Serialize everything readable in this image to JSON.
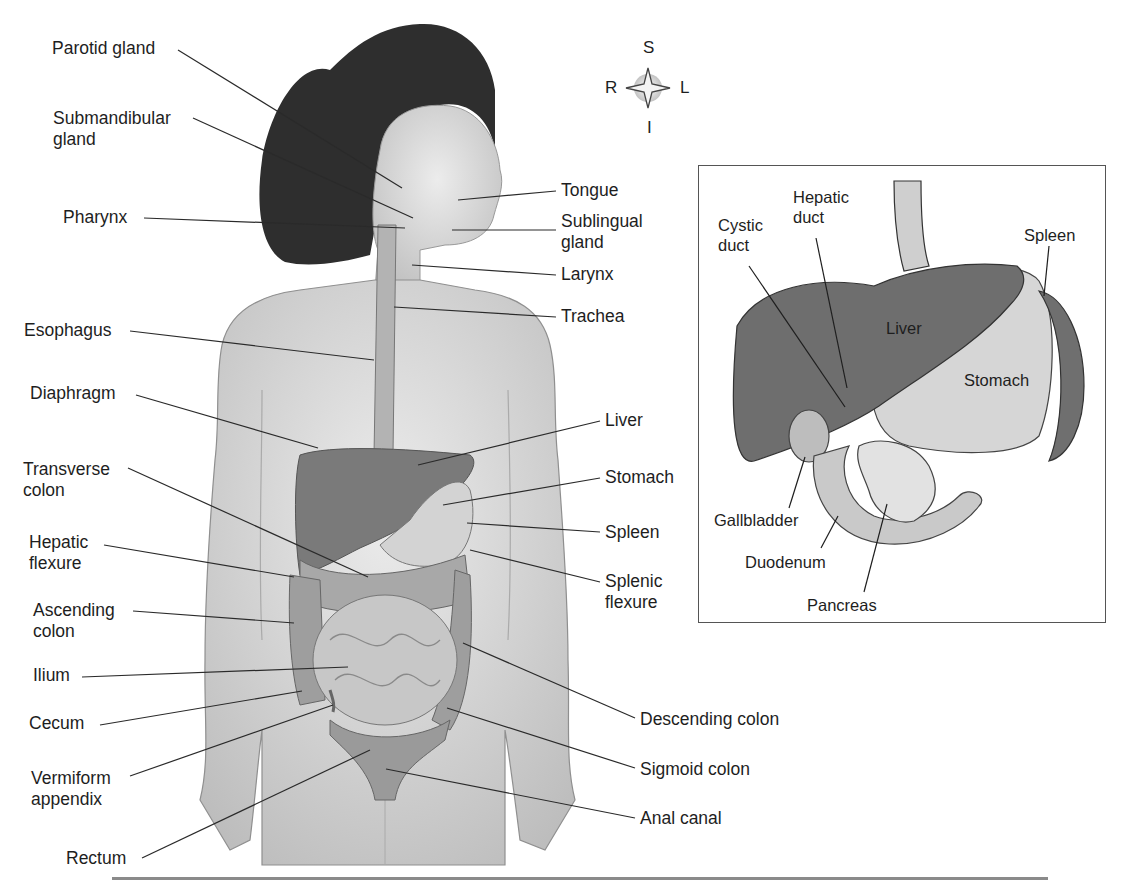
{
  "figure": {
    "compass": {
      "superior": "S",
      "inferior": "I",
      "right": "R",
      "left": "L"
    },
    "left_labels": [
      {
        "id": "parotid",
        "text": "Parotid gland",
        "x": 52,
        "y": 38
      },
      {
        "id": "submandibular",
        "text": "Submandibular\ngland",
        "x": 53,
        "y": 108
      },
      {
        "id": "pharynx",
        "text": "Pharynx",
        "x": 63,
        "y": 207
      },
      {
        "id": "esophagus",
        "text": "Esophagus",
        "x": 24,
        "y": 320
      },
      {
        "id": "diaphragm",
        "text": "Diaphragm",
        "x": 30,
        "y": 383
      },
      {
        "id": "transverse-colon",
        "text": "Transverse\ncolon",
        "x": 23,
        "y": 459
      },
      {
        "id": "hepatic-flexure",
        "text": "Hepatic\nflexure",
        "x": 29,
        "y": 532
      },
      {
        "id": "ascending-colon",
        "text": "Ascending\ncolon",
        "x": 33,
        "y": 600
      },
      {
        "id": "ilium",
        "text": "Ilium",
        "x": 33,
        "y": 665
      },
      {
        "id": "cecum",
        "text": "Cecum",
        "x": 29,
        "y": 713
      },
      {
        "id": "vermiform-appendix",
        "text": "Vermiform\nappendix",
        "x": 31,
        "y": 768
      },
      {
        "id": "rectum",
        "text": "Rectum",
        "x": 66,
        "y": 848
      }
    ],
    "right_labels": [
      {
        "id": "tongue",
        "text": "Tongue",
        "x": 561,
        "y": 180
      },
      {
        "id": "sublingual",
        "text": "Sublingual\ngland",
        "x": 561,
        "y": 211
      },
      {
        "id": "larynx",
        "text": "Larynx",
        "x": 561,
        "y": 264
      },
      {
        "id": "trachea",
        "text": "Trachea",
        "x": 561,
        "y": 306
      },
      {
        "id": "liver",
        "text": "Liver",
        "x": 605,
        "y": 410
      },
      {
        "id": "stomach",
        "text": "Stomach",
        "x": 605,
        "y": 467
      },
      {
        "id": "spleen",
        "text": "Spleen",
        "x": 605,
        "y": 522
      },
      {
        "id": "splenic-flexure",
        "text": "Splenic\nflexure",
        "x": 605,
        "y": 571
      },
      {
        "id": "descending-colon",
        "text": "Descending colon",
        "x": 640,
        "y": 709
      },
      {
        "id": "sigmoid-colon",
        "text": "Sigmoid colon",
        "x": 640,
        "y": 759
      },
      {
        "id": "anal-canal",
        "text": "Anal canal",
        "x": 640,
        "y": 808
      }
    ],
    "inset_labels": [
      {
        "id": "cystic-duct",
        "text": "Cystic\nduct",
        "x": 717,
        "y": 214
      },
      {
        "id": "hepatic-duct",
        "text": "Hepatic\nduct",
        "x": 792,
        "y": 186
      },
      {
        "id": "spleen-inset",
        "text": "Spleen",
        "x": 1023,
        "y": 224
      },
      {
        "id": "liver-inset",
        "text": "Liver",
        "x": 885,
        "y": 317
      },
      {
        "id": "stomach-inset",
        "text": "Stomach",
        "x": 963,
        "y": 369
      },
      {
        "id": "gallbladder",
        "text": "Gallbladder",
        "x": 713,
        "y": 509
      },
      {
        "id": "duodenum",
        "text": "Duodenum",
        "x": 744,
        "y": 551
      },
      {
        "id": "pancreas",
        "text": "Pancreas",
        "x": 806,
        "y": 594
      }
    ],
    "colors": {
      "background": "#ffffff",
      "skin": "#d9d9d9",
      "hair": "#2b2b2b",
      "liver": "#6e6e6e",
      "stomach": "#cfcfcf",
      "intestine": "#bdbdbd",
      "colon": "#9a9a9a",
      "leader_line": "#2a2a2a",
      "rule": "#8a8a8a"
    }
  }
}
